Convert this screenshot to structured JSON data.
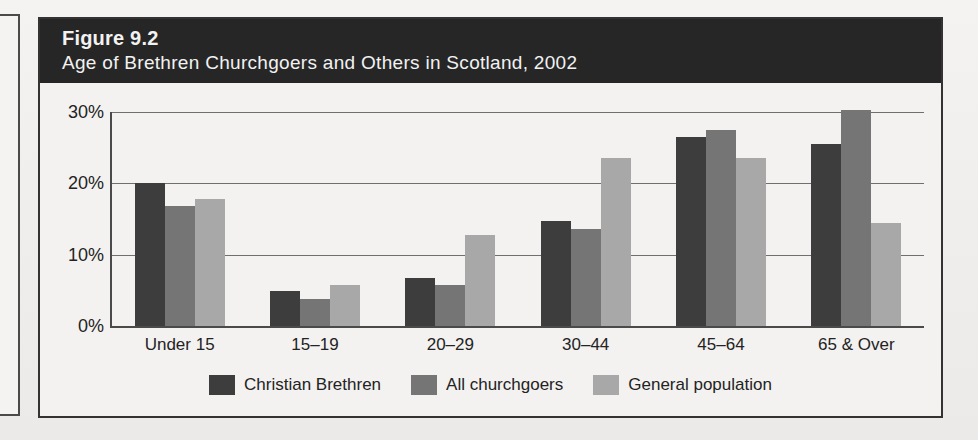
{
  "figure": {
    "number": "Figure 9.2",
    "title": "Age of Brethren Churchgoers and Others in Scotland, 2002"
  },
  "colors": {
    "banner_background": "#262626",
    "banner_text": "#f2f2f2",
    "frame_border": "#333333",
    "page_background": "#f2f1ef",
    "plot_background": "#f3f2f0",
    "axis": "#4a4a4a",
    "gridline": "#6f6f6f",
    "series_christian_brethren": "#3d3d3d",
    "series_all_churchgoers": "#757575",
    "series_general_population": "#a8a8a8"
  },
  "legend": {
    "position": "bottom-center",
    "items": [
      {
        "label": "Christian Brethren",
        "color": "#3d3d3d"
      },
      {
        "label": "All churchgoers",
        "color": "#757575"
      },
      {
        "label": "General population",
        "color": "#a8a8a8"
      }
    ]
  },
  "ghost_text": "",
  "chart_data": {
    "type": "bar",
    "title": "Age of Brethren Churchgoers and Others in Scotland, 2002",
    "xlabel": "",
    "ylabel": "",
    "categories": [
      "Under 15",
      "15–19",
      "20–29",
      "30–44",
      "45–64",
      "65 & Over"
    ],
    "series": [
      {
        "name": "Christian Brethren",
        "color": "#3d3d3d",
        "values": [
          20.0,
          4.9,
          6.8,
          14.7,
          26.5,
          25.5
        ]
      },
      {
        "name": "All churchgoers",
        "color": "#757575",
        "values": [
          16.8,
          3.8,
          5.7,
          13.6,
          27.5,
          30.3
        ]
      },
      {
        "name": "General population",
        "color": "#a8a8a8",
        "values": [
          17.8,
          5.8,
          12.7,
          23.6,
          23.5,
          14.5
        ]
      }
    ],
    "ylim": [
      0,
      30
    ],
    "ytick_values": [
      0,
      10,
      20,
      30
    ],
    "ytick_labels": [
      "0%",
      "10%",
      "20%",
      "30%"
    ],
    "grid": true,
    "grid_axis": "y",
    "legend_position": "bottom",
    "value_suffix": "%"
  }
}
